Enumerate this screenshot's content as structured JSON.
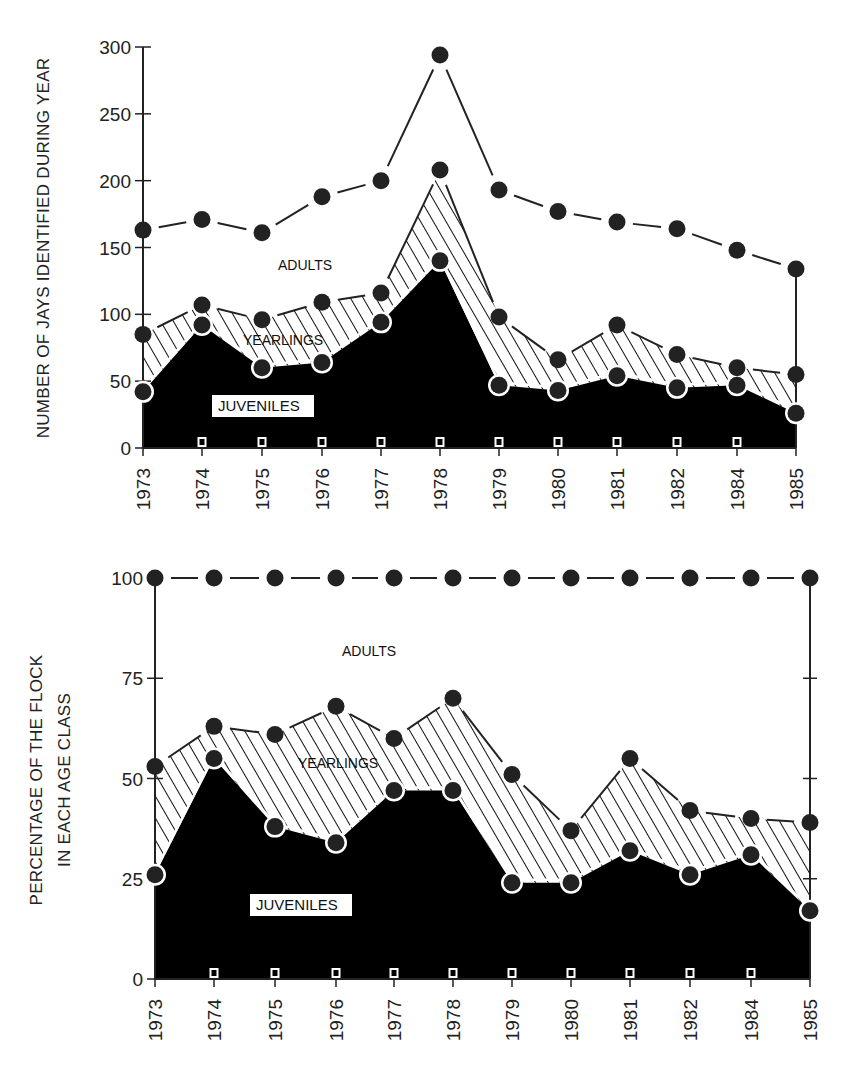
{
  "chart_data": [
    {
      "type": "area",
      "title": "",
      "xlabel": "",
      "ylabel": "NUMBER OF JAYS IDENTIFIED DURING YEAR",
      "ylim": [
        0,
        300
      ],
      "yticks": [
        0,
        50,
        100,
        150,
        200,
        250,
        300
      ],
      "categories": [
        "1973",
        "1974",
        "1975",
        "1976",
        "1977",
        "1978",
        "1979",
        "1980",
        "1981",
        "1982",
        "1984",
        "1985"
      ],
      "stacked_cumulative": true,
      "series": [
        {
          "name": "JUVENILES",
          "fill": "solid-black",
          "values": [
            42,
            92,
            60,
            64,
            94,
            140,
            47,
            43,
            54,
            45,
            47,
            26
          ]
        },
        {
          "name": "YEARLINGS",
          "fill": "hatched",
          "values": [
            85,
            107,
            96,
            109,
            116,
            208,
            98,
            66,
            92,
            70,
            60,
            55
          ]
        },
        {
          "name": "ADULTS",
          "fill": "white",
          "values": [
            163,
            171,
            161,
            188,
            200,
            294,
            193,
            177,
            169,
            164,
            148,
            134
          ]
        }
      ],
      "region_labels": [
        "ADULTS",
        "YEARLINGS",
        "JUVENILES"
      ],
      "grid": false,
      "legend": "inline labels"
    },
    {
      "type": "area",
      "title": "",
      "xlabel": "",
      "ylabel": "PERCENTAGE OF THE FLOCK IN EACH AGE CLASS",
      "ylim": [
        0,
        100
      ],
      "yticks": [
        0,
        25,
        50,
        75,
        100
      ],
      "categories": [
        "1973",
        "1974",
        "1975",
        "1976",
        "1977",
        "1978",
        "1979",
        "1980",
        "1981",
        "1982",
        "1984",
        "1985"
      ],
      "stacked_cumulative": true,
      "series": [
        {
          "name": "JUVENILES",
          "fill": "solid-black",
          "values": [
            26,
            55,
            38,
            34,
            47,
            47,
            24,
            24,
            32,
            26,
            31,
            17
          ]
        },
        {
          "name": "YEARLINGS",
          "fill": "hatched",
          "values": [
            53,
            63,
            61,
            68,
            60,
            70,
            51,
            37,
            55,
            42,
            40,
            39
          ]
        },
        {
          "name": "ADULTS",
          "fill": "white",
          "values": [
            100,
            100,
            100,
            100,
            100,
            100,
            100,
            100,
            100,
            100,
            100,
            100
          ]
        }
      ],
      "region_labels": [
        "ADULTS",
        "YEARLINGS",
        "JUVENILES"
      ],
      "grid": false,
      "legend": "inline labels"
    }
  ],
  "top": {
    "ylabel": "NUMBER OF JAYS IDENTIFIED DURING YEAR",
    "yticks": [
      "0",
      "50",
      "100",
      "150",
      "200",
      "250",
      "300"
    ],
    "labels": {
      "adults": "ADULTS",
      "yearlings": "YEARLINGS",
      "juveniles": "JUVENILES"
    }
  },
  "bottom": {
    "ylabel_line1": "PERCENTAGE OF THE FLOCK",
    "ylabel_line2": "IN EACH AGE CLASS",
    "yticks": [
      "0",
      "25",
      "50",
      "75",
      "100"
    ],
    "labels": {
      "adults": "ADULTS",
      "yearlings": "YEARLINGS",
      "juveniles": "JUVENILES"
    }
  },
  "years": [
    "1973",
    "1974",
    "1975",
    "1976",
    "1977",
    "1978",
    "1979",
    "1980",
    "1981",
    "1982",
    "1984",
    "1985"
  ]
}
